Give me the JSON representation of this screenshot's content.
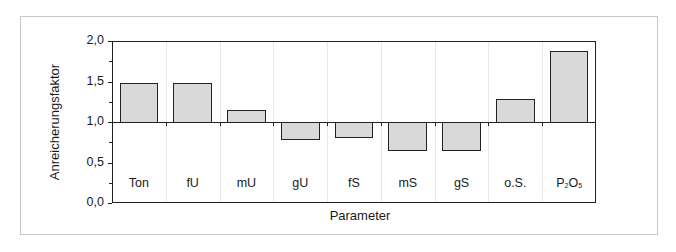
{
  "chart_data": {
    "type": "bar",
    "title": "",
    "xlabel": "Parameter",
    "ylabel": "Anreicherungsfaktor",
    "ylim": [
      0.0,
      2.0
    ],
    "baseline": 1.0,
    "yticks": [
      "0,0",
      "0,5",
      "1,0",
      "1,5",
      "2,0"
    ],
    "ytick_values": [
      0.0,
      0.5,
      1.0,
      1.5,
      2.0
    ],
    "categories": [
      "Ton",
      "fU",
      "mU",
      "gU",
      "fS",
      "mS",
      "gS",
      "o.S.",
      "P2O5"
    ],
    "values": [
      1.48,
      1.48,
      1.15,
      0.79,
      0.81,
      0.66,
      0.66,
      1.29,
      1.88
    ],
    "grid": false,
    "legend": null,
    "bar_color": "#d9d9d9",
    "edge_color": "#222222"
  },
  "labels": {
    "xlabel": "Parameter",
    "ylabel": "Anreicherungsfaktor",
    "y": [
      "0,0",
      "0,5",
      "1,0",
      "1,5",
      "2,0"
    ],
    "cats": [
      "Ton",
      "fU",
      "mU",
      "gU",
      "fS",
      "mS",
      "gS",
      "o.S."
    ],
    "p2o5": {
      "p": "P",
      "sub1": "2",
      "o": "O",
      "sub2": "5"
    }
  }
}
